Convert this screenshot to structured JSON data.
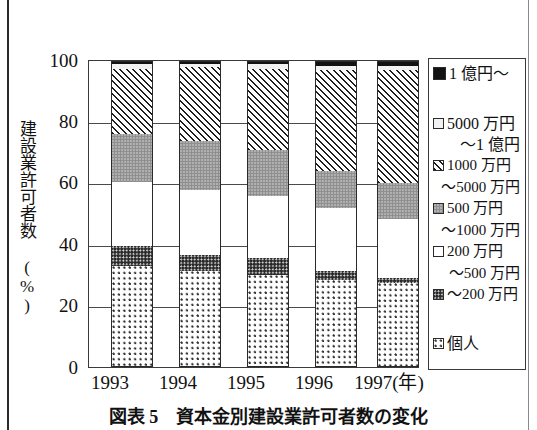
{
  "chart_data": {
    "type": "bar",
    "subtype": "stacked-100-percent",
    "title": "",
    "xlabel": "年",
    "ylabel": "建設業許可者数 (%)",
    "categories": [
      "1993",
      "1994",
      "1995",
      "1996",
      "1997"
    ],
    "ylim": [
      0,
      100
    ],
    "yticks": [
      0,
      20,
      40,
      60,
      80,
      100
    ],
    "grid": true,
    "legend_position": "right",
    "series": [
      {
        "name": "個人",
        "pattern": "coarse-dot-light",
        "values": [
          33.0,
          31.5,
          30.0,
          28.5,
          27.5
        ]
      },
      {
        "name": "〜200万円",
        "pattern": "fine-dot-dark",
        "values": [
          6.5,
          5.0,
          5.5,
          3.0,
          1.5
        ]
      },
      {
        "name": "200万円〜500万円",
        "pattern": "white",
        "values": [
          21.0,
          21.5,
          20.5,
          20.5,
          19.5
        ]
      },
      {
        "name": "500万円〜1000万円",
        "pattern": "solid-gray",
        "values": [
          15.5,
          16.0,
          15.0,
          12.0,
          11.5
        ]
      },
      {
        "name": "1000万円〜5000万円",
        "pattern": "diagonal-hatch",
        "values": [
          21.5,
          24.0,
          26.5,
          33.0,
          37.0
        ]
      },
      {
        "name": "5000万円〜1億円",
        "pattern": "light-gray",
        "values": [
          1.5,
          1.0,
          1.5,
          1.5,
          1.5
        ]
      },
      {
        "name": "1億円〜",
        "pattern": "solid-black",
        "values": [
          1.0,
          1.0,
          1.0,
          1.5,
          1.5
        ]
      }
    ]
  },
  "axis": {
    "y_title": "建設業許可者数 (%)",
    "y_ticks": [
      "100",
      "80",
      "60",
      "40",
      "20",
      "0"
    ],
    "x_ticks": [
      "1993",
      "1994",
      "1995",
      "1996",
      "1997"
    ],
    "x_unit_suffix": "(年)",
    "x_last_label": "1997(年)"
  },
  "legend": {
    "entries": [
      {
        "key": "oku",
        "label": "1 億円〜",
        "cont": "",
        "swatch": "solid-black"
      },
      {
        "key": "man5000",
        "label": "5000 万円",
        "cont": "〜1 億円",
        "swatch": "light-gray"
      },
      {
        "key": "man1000",
        "label": "1000 万円",
        "cont": "〜5000 万円",
        "swatch": "diagonal-hatch"
      },
      {
        "key": "man500",
        "label": "500 万円",
        "cont": "〜1000 万円",
        "swatch": "solid-gray"
      },
      {
        "key": "man200",
        "label": "200 万円",
        "cont": "〜500 万円",
        "swatch": "white"
      },
      {
        "key": "under200",
        "label": "〜200 万円",
        "cont": "",
        "swatch": "fine-dot-dark"
      },
      {
        "key": "kojin",
        "label": "個人",
        "cont": "",
        "swatch": "coarse-dot-light"
      }
    ]
  },
  "caption": {
    "text": "図表 5　資本金別建設業許可者数の変化"
  },
  "colors": {
    "ink": "#111111",
    "axis": "#3a3a3a",
    "grid": "#4a4a4a",
    "black_fill": "#121212",
    "gray_fill": "#8f8f8f",
    "light_fill": "#f2f2f2",
    "page_bg": "#ffffff"
  }
}
